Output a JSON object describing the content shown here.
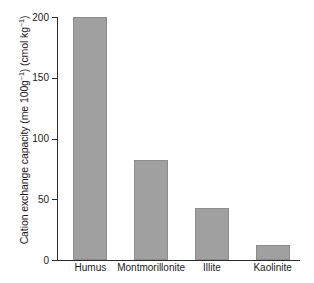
{
  "chart_data": {
    "type": "bar",
    "title": "",
    "xlabel": "",
    "ylabel": "Cation exchange capacity (me 100g-1) (cmol kg-1)",
    "ylabel_parts": {
      "lead": "Cation exchange capacity (me 100g",
      "sup1": "−1",
      "mid": ") (cmol kg",
      "sup2": "−1",
      "tail": ")"
    },
    "categories": [
      "Humus",
      "Montmorillonite",
      "Illite",
      "Kaolinite"
    ],
    "values": [
      200,
      82,
      43,
      12
    ],
    "ylim": [
      0,
      200
    ],
    "yticks": [
      0,
      50,
      100,
      150,
      200
    ],
    "ytick_labels": [
      "0",
      "50",
      "100",
      "150",
      "200"
    ],
    "grid": false,
    "legend": false,
    "bar_color": "#a0a0a0",
    "bar_edge_color": "#8c8c8c",
    "axis_color": "#2b2b2b",
    "background_color": "#ffffff"
  }
}
